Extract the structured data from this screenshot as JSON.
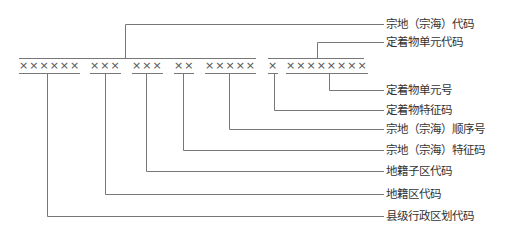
{
  "segments": [
    {
      "id": "county",
      "text": "××××××"
    },
    {
      "id": "cadastral-district",
      "text": "×××"
    },
    {
      "id": "cadastral-subdistrict",
      "text": "×××"
    },
    {
      "id": "parcel-feature",
      "text": "××"
    },
    {
      "id": "parcel-sequence",
      "text": "×××××"
    },
    {
      "id": "fixture-feature",
      "text": "×"
    },
    {
      "id": "fixture-unit-number",
      "text": "××××××××"
    }
  ],
  "labels": {
    "parcel_code": "宗地（宗海）代码",
    "fixture_unit_code": "定着物单元代码",
    "fixture_unit_number": "定着物单元号",
    "fixture_feature_code": "定着物特征码",
    "parcel_sequence_number": "宗地（宗海）顺序号",
    "parcel_feature_code": "宗地（宗海）特征码",
    "cadastral_subdistrict_code": "地籍子区代码",
    "cadastral_district_code": "地籍区代码",
    "county_admin_code": "县级行政区划代码"
  }
}
